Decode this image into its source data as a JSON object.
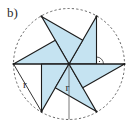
{
  "figure": {
    "part_label": "b)",
    "center": [
      69,
      64
    ],
    "radius": 55,
    "blade_count": 6,
    "colors": {
      "fill": "#c5e3f1",
      "stroke": "#1c1c1c",
      "circle": "#555555",
      "background": "#ffffff"
    },
    "labels": {
      "radius_side": "r",
      "radius_vertical": "r"
    },
    "right_angle_marker": true
  }
}
